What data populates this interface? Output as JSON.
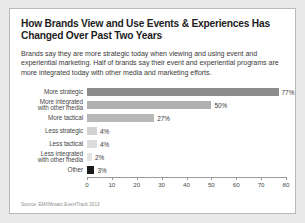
{
  "card": {
    "title": "How Brands View and Use Events & Experiences Has Changed Over Past Two Years",
    "lede": "Brands say they are more strategic today when viewing and using event and experiential marketing. Half of brands say their event and experiential programs are more integrated today with other media and marketing efforts.",
    "source": "Source: EMI/Mosaic EventTrack 2013"
  },
  "chart_data": {
    "type": "bar",
    "orientation": "horizontal",
    "title": "How Brands View and Use Events & Experiences Has Changed Over Past Two Years",
    "xlabel": "",
    "ylabel": "",
    "xlim": [
      0,
      80
    ],
    "xticks": [
      0,
      10,
      20,
      30,
      40,
      50,
      60,
      70,
      80
    ],
    "grid": false,
    "legend": "none",
    "categories": [
      "More strategic",
      "More integrated with other media",
      "More tactical",
      "Less strategic",
      "Less tactical",
      "Less integrated with other media",
      "Other"
    ],
    "values": [
      77,
      50,
      27,
      4,
      4,
      2,
      3
    ],
    "value_labels": [
      "77%",
      "50%",
      "27%",
      "4%",
      "4%",
      "2%",
      "3%"
    ],
    "bar_colors": [
      "#8c8c8c",
      "#b0b0b0",
      "#b8b8b8",
      "#d2d2d2",
      "#dcdcdc",
      "#e4e4e4",
      "#1a1a1a"
    ],
    "bars": [
      {
        "label_line1": "More strategic",
        "label_line2": "",
        "value": 77,
        "value_label": "77%",
        "color": "#8c8c8c"
      },
      {
        "label_line1": "More integrated",
        "label_line2": "with other media",
        "value": 50,
        "value_label": "50%",
        "color": "#b0b0b0"
      },
      {
        "label_line1": "More tactical",
        "label_line2": "",
        "value": 27,
        "value_label": "27%",
        "color": "#b8b8b8"
      },
      {
        "label_line1": "Less strategic",
        "label_line2": "",
        "value": 4,
        "value_label": "4%",
        "color": "#d2d2d2"
      },
      {
        "label_line1": "Less tactical",
        "label_line2": "",
        "value": 4,
        "value_label": "4%",
        "color": "#dcdcdc"
      },
      {
        "label_line1": "Less integrated",
        "label_line2": "with other media",
        "value": 2,
        "value_label": "2%",
        "color": "#e4e4e4"
      },
      {
        "label_line1": "Other",
        "label_line2": "",
        "value": 3,
        "value_label": "3%",
        "color": "#1a1a1a"
      }
    ],
    "axis": {
      "ticks": [
        {
          "label": "0",
          "value": 0
        },
        {
          "label": "10",
          "value": 10
        },
        {
          "label": "20",
          "value": 20
        },
        {
          "label": "30",
          "value": 30
        },
        {
          "label": "40",
          "value": 40
        },
        {
          "label": "50",
          "value": 50
        },
        {
          "label": "60",
          "value": 60
        },
        {
          "label": "70",
          "value": 70
        },
        {
          "label": "80",
          "value": 80
        }
      ]
    }
  }
}
